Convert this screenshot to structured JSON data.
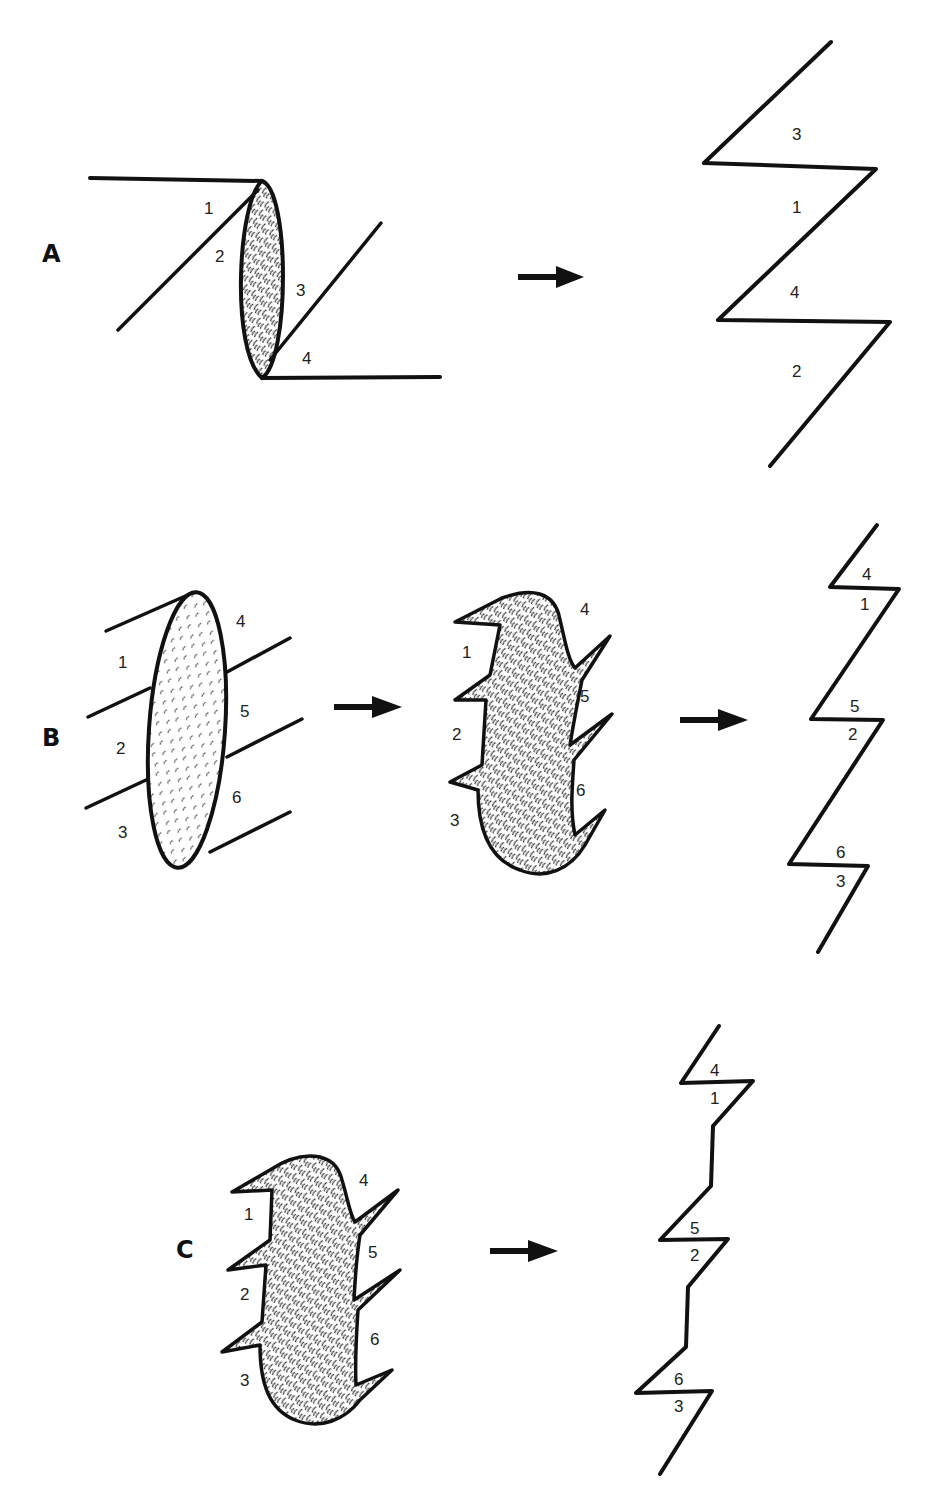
{
  "figure": {
    "panels": [
      {
        "id": "A",
        "label": "A",
        "before": {
          "segment_labels": [
            "1",
            "2",
            "3",
            "4"
          ]
        },
        "after": {
          "segment_labels_top_to_bottom": [
            "3",
            "1",
            "4",
            "2"
          ]
        }
      },
      {
        "id": "B",
        "label": "B",
        "stage1": {
          "segment_labels_left": [
            "1",
            "2",
            "3"
          ],
          "segment_labels_right": [
            "4",
            "5",
            "6"
          ]
        },
        "stage2": {
          "segment_labels_left": [
            "1",
            "2",
            "3"
          ],
          "segment_labels_right": [
            "4",
            "5",
            "6"
          ]
        },
        "stage3": {
          "pairs_top_to_bottom": [
            [
              "4",
              "1"
            ],
            [
              "5",
              "2"
            ],
            [
              "6",
              "3"
            ]
          ]
        }
      },
      {
        "id": "C",
        "label": "C",
        "before": {
          "segment_labels_left": [
            "1",
            "2",
            "3"
          ],
          "segment_labels_right": [
            "4",
            "5",
            "6"
          ]
        },
        "after": {
          "pairs_top_to_bottom": [
            [
              "4",
              "1"
            ],
            [
              "5",
              "2"
            ],
            [
              "6",
              "3"
            ]
          ]
        }
      }
    ],
    "arrow_icon": "right-arrow",
    "colors": {
      "ink": "#111111",
      "background": "#ffffff"
    }
  }
}
